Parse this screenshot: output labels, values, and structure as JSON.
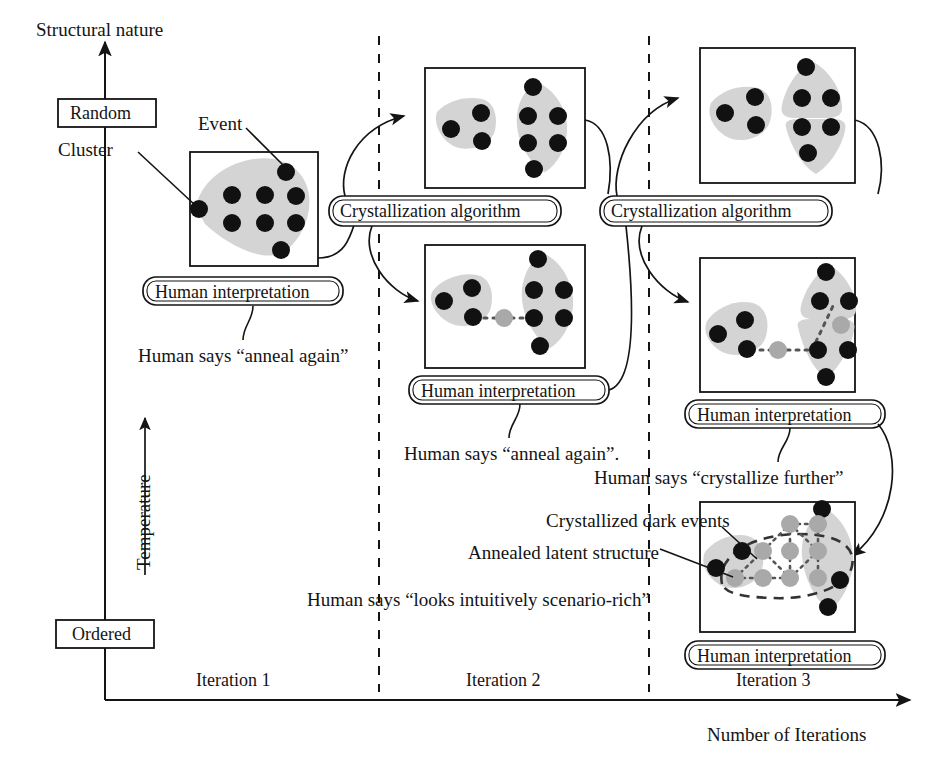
{
  "figure": {
    "domain": "diagram",
    "type": "annealing-crystallization-iteration-diagram",
    "background": "#ffffff",
    "ink": "#141414",
    "cluster_fill": "#d4d4d4",
    "dark_event": "#111111",
    "light_event": "#a9a9a9"
  },
  "axes": {
    "y_title": "Structural nature",
    "y_top_tick": "Random",
    "y_bottom_tick": "Ordered",
    "y_secondary_title": "Temperature",
    "x_title": "Number of Iterations",
    "x_ticks": [
      "Iteration 1",
      "Iteration 2",
      "Iteration 3"
    ]
  },
  "callouts": {
    "event": "Event",
    "cluster": "Cluster",
    "crystallized_dark_events": "Crystallized dark events",
    "annealed_latent_structure": "Annealed latent structure"
  },
  "pills": {
    "human_interpretation": "Human interpretation",
    "crystallization_algorithm": "Crystallization algorithm"
  },
  "human_says": {
    "iter1": "Human says “anneal again”",
    "iter2": "Human says “anneal again”.",
    "iter3_crystallize": "Human says “crystallize further”",
    "iter3_final": "Human says “looks intuitively scenario-rich”"
  },
  "panels": [
    {
      "id": "iter1-box",
      "iteration": "Iteration 1",
      "stage": "initial",
      "dark_events": 9,
      "light_events": 0,
      "clusters": 1,
      "caption": "Human interpretation"
    },
    {
      "id": "iter2-top-box",
      "iteration": "Iteration 2",
      "stage": "after-crystallization",
      "dark_events": 9,
      "light_events": 0,
      "clusters": 2,
      "caption": ""
    },
    {
      "id": "iter2-bottom-box",
      "iteration": "Iteration 2",
      "stage": "after-human-interpretation",
      "dark_events": 9,
      "light_events": 1,
      "clusters": 2,
      "caption": "Human interpretation"
    },
    {
      "id": "iter3-top-box",
      "iteration": "Iteration 3",
      "stage": "after-crystallization",
      "dark_events": 9,
      "light_events": 0,
      "clusters": 3,
      "caption": ""
    },
    {
      "id": "iter3-mid-box",
      "iteration": "Iteration 3",
      "stage": "after-human-interpretation",
      "dark_events": 9,
      "light_events": 2,
      "clusters": 3,
      "caption": "Human interpretation"
    },
    {
      "id": "iter3-final-box",
      "iteration": "Iteration 3",
      "stage": "crystallized-scenario-rich",
      "dark_events": 5,
      "light_events": 9,
      "clusters": 2,
      "caption": "Human interpretation"
    }
  ]
}
